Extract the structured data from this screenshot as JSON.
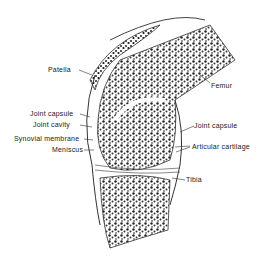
{
  "figure": {
    "labels": {
      "patella": "Patella",
      "femur": "Femur",
      "joint_capsule_left": "Joint capsule",
      "joint_cavity": "Joint cavity",
      "synovial_membrane": "Synovial membrane",
      "meniscus": "Meniscus",
      "joint_capsule_right": "Joint capsule",
      "articular_cartilage": "Articular cartilage",
      "tibia": "Tibia"
    },
    "colors": {
      "ink": "#222222",
      "background": "#ffffff"
    }
  }
}
